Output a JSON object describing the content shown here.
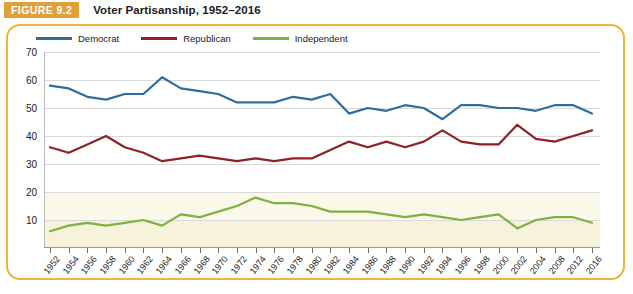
{
  "figure": {
    "tag": "FIGURE 9.2",
    "title": "Voter Partisanship, 1952–2016"
  },
  "legend": {
    "position": "top-left",
    "items": [
      {
        "label": "Democrat",
        "color": "#2E6D9E"
      },
      {
        "label": "Republican",
        "color": "#8E2226"
      },
      {
        "label": "Independent",
        "color": "#7FB142"
      }
    ]
  },
  "colors": {
    "accent_border": "#F0B33C",
    "tag_background": "#E0A13A",
    "democrat": "#2E6D9E",
    "republican": "#8E2226",
    "independent": "#7FB142",
    "gridline": "#d9d9d9",
    "band_20": "#FAF8E8",
    "band_10": "#F7F3DA"
  },
  "axes": {
    "y_ticks": [
      70,
      60,
      50,
      40,
      30,
      20,
      10
    ],
    "ylim": [
      0,
      70
    ],
    "ylabel": "",
    "xlabel": "",
    "grid": true
  },
  "chart_data": {
    "type": "line",
    "title": "Voter Partisanship, 1952–2016",
    "xlabel": "",
    "ylabel": "",
    "ylim": [
      0,
      70
    ],
    "grid": true,
    "legend_position": "top-left",
    "categories": [
      "1952",
      "1954",
      "1956",
      "1958",
      "1960",
      "1962",
      "1964",
      "1966",
      "1968",
      "1970",
      "1972",
      "1974",
      "1976",
      "1978",
      "1980",
      "1982",
      "1984",
      "1986",
      "1988",
      "1990",
      "1992",
      "1994",
      "1996",
      "1998",
      "2000",
      "2002",
      "2004",
      "2008",
      "2012",
      "2016"
    ],
    "series": [
      {
        "name": "Democrat",
        "color": "#2E6D9E",
        "values": [
          58,
          57,
          54,
          53,
          55,
          55,
          61,
          57,
          56,
          55,
          52,
          52,
          52,
          54,
          53,
          55,
          48,
          50,
          49,
          51,
          50,
          46,
          51,
          51,
          50,
          50,
          49,
          51,
          51,
          48
        ]
      },
      {
        "name": "Republican",
        "color": "#8E2226",
        "values": [
          36,
          34,
          37,
          40,
          36,
          34,
          31,
          32,
          33,
          32,
          31,
          32,
          31,
          32,
          32,
          35,
          38,
          36,
          38,
          36,
          38,
          42,
          38,
          37,
          37,
          44,
          39,
          38,
          40,
          42
        ]
      },
      {
        "name": "Independent",
        "color": "#7FB142",
        "values": [
          6,
          8,
          9,
          8,
          9,
          10,
          8,
          12,
          11,
          13,
          15,
          18,
          16,
          16,
          15,
          13,
          13,
          13,
          12,
          11,
          12,
          11,
          10,
          11,
          12,
          7,
          10,
          11,
          11,
          9
        ]
      }
    ]
  }
}
